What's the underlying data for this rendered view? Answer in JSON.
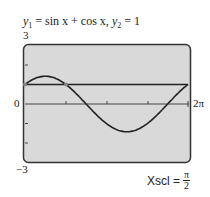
{
  "chart_data": {
    "type": "line",
    "title": "y1 = sin x + cos x,  y2 = 1",
    "series": [
      {
        "name": "y1",
        "expression": "sin x + cos x"
      },
      {
        "name": "y2",
        "expression": "1"
      }
    ],
    "xlim": [
      0,
      6.2832
    ],
    "ylim": [
      -3,
      3
    ],
    "x_tick_labels": [
      "0",
      "2π"
    ],
    "y_tick_labels": [
      "3",
      "-3"
    ],
    "xscl": "π/2",
    "intersections": [
      [
        0,
        1
      ],
      [
        1.5708,
        1
      ],
      [
        6.2832,
        1
      ]
    ],
    "grid": false
  },
  "labels": {
    "title_y1": "y",
    "title_sub1": "1",
    "title_expr1": " = sin x + cos x,  ",
    "title_y2": "y",
    "title_sub2": "2",
    "title_expr2": " = 1",
    "ymax": "3",
    "ymin": "−3",
    "xmin": "0",
    "xmax": "2π",
    "xscl_label": "Xscl =",
    "xscl_num": "π",
    "xscl_den": "2"
  },
  "colors": {
    "screen": "#d9d9d9",
    "curve": "#222222",
    "frame": "#333333"
  }
}
